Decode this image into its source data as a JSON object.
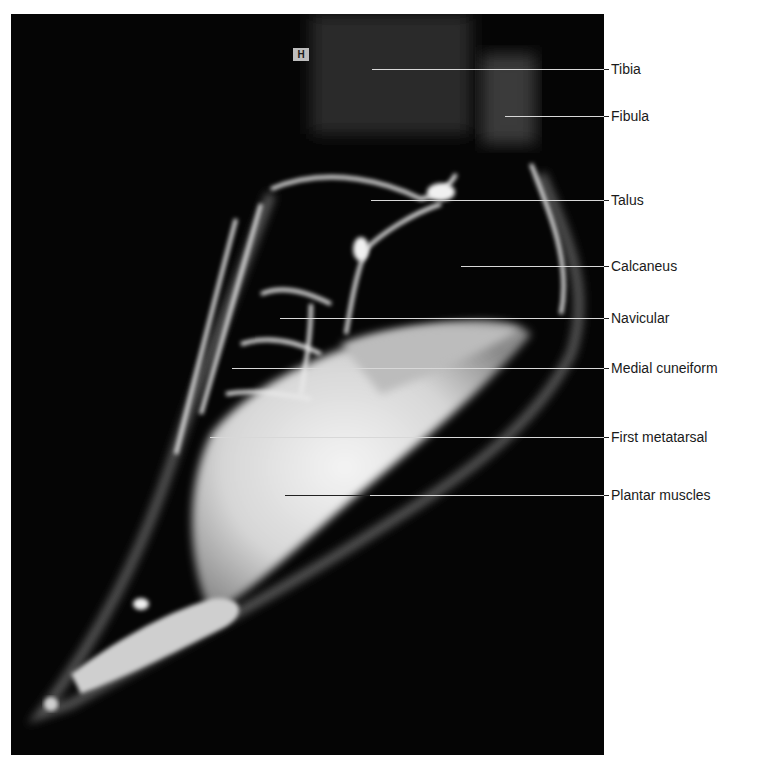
{
  "figure": {
    "orientation_marker": "H",
    "labels": [
      {
        "name": "tibia",
        "text": "Tibia",
        "y": 69,
        "x_start": 372
      },
      {
        "name": "fibula",
        "text": "Fibula",
        "y": 116,
        "x_start": 505
      },
      {
        "name": "talus",
        "text": "Talus",
        "y": 200,
        "x_start": 371
      },
      {
        "name": "calcaneus",
        "text": "Calcaneus",
        "y": 266,
        "x_start": 461
      },
      {
        "name": "navicular",
        "text": "Navicular",
        "y": 318,
        "x_start": 280
      },
      {
        "name": "medial-cuneiform",
        "text": "Medial cuneiform",
        "y": 368,
        "x_start": 232
      },
      {
        "name": "first-metatarsal",
        "text": "First metatarsal",
        "y": 437,
        "x_start": 210
      },
      {
        "name": "plantar-muscles",
        "text": "Plantar muscles",
        "y": 495,
        "x_start": 285
      }
    ]
  }
}
